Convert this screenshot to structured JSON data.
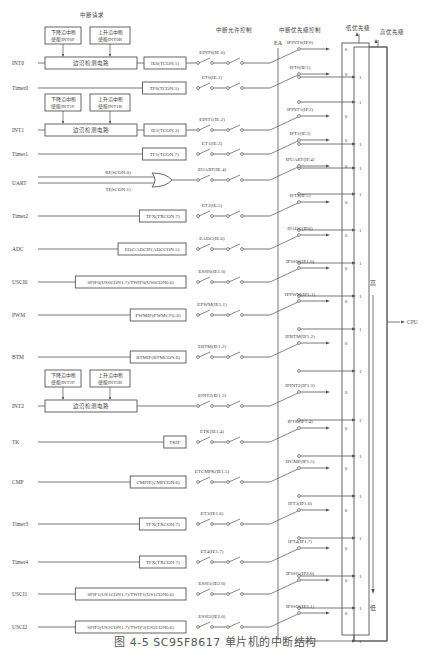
{
  "headers": {
    "interrupt_request": "中断请求",
    "enable_control": "中断允许控制",
    "priority_control": "中断优先级控制",
    "ea": "EA",
    "low_priority": "低优先级",
    "high_priority": "高优先级",
    "high_label": "高",
    "low_label": "低",
    "cpu": "CPU",
    "bit0": "0",
    "bit1": "1"
  },
  "edge_boxes": {
    "int0": {
      "falling": [
        "下降沿中断",
        "使能INT0F"
      ],
      "rising": [
        "上升沿中断",
        "使能INT0R"
      ],
      "detector": "边沿检测电路"
    },
    "int1": {
      "falling": [
        "下降沿中断",
        "使能INT1F"
      ],
      "rising": [
        "上升沿中断",
        "使能INT1R"
      ],
      "detector": "边沿检测电路"
    },
    "int2": {
      "falling": [
        "下降沿中断",
        "使能INT2F"
      ],
      "rising": [
        "上升沿中断",
        "使能INT2R"
      ],
      "detector": "边沿检测电路"
    }
  },
  "uart_inputs": {
    "ri": "RI(SCON.0)",
    "ti": "TI(SCON.1)"
  },
  "sources": [
    {
      "name": "INT0",
      "flag": "IE0(TCON.1)",
      "enable": "EINT0(IE.0)",
      "priority": "IPINT0(IP.0)",
      "type": "edge",
      "edge": "int0"
    },
    {
      "name": "Timer0",
      "flag": "TF0(TCON.5)",
      "enable": "ET0(IE.1)",
      "priority": "IPT0(IP.1)"
    },
    {
      "name": "INT1",
      "flag": "IE1(TCON.3)",
      "enable": "EINT1(IE.2)",
      "priority": "IPINT1(IP.2)",
      "type": "edge",
      "edge": "int1"
    },
    {
      "name": "Timer1",
      "flag": "TF1(TCON.7)",
      "enable": "ET1(IE.3)",
      "priority": "IPT1(IP.3)"
    },
    {
      "name": "UART",
      "flag": "",
      "enable": "EUART(IE.4)",
      "priority": "IPUART(IP.4)",
      "type": "or"
    },
    {
      "name": "Timer2",
      "flag": "TFX(TXCON.7)",
      "enable": "ET2(IE.5)",
      "priority": "IPT2(IP.5)"
    },
    {
      "name": "ADC",
      "flag": "EOC/ADCIF(ADCCON.5)",
      "enable": "EADC(IE.6)",
      "priority": "IPADC(IP.6)"
    },
    {
      "name": "USCI0",
      "flag": "SPIF0(US0CON1.7)/TWIF0(US0CON0.6)",
      "enable": "ESSI0(IE1.0)",
      "priority": "IPSSI0(IP1.0)"
    },
    {
      "name": "PWM",
      "flag": "PWMIF(PWMCFG.6)",
      "enable": "EPWM(IE1.1)",
      "priority": "IPPWM(IP1.1)"
    },
    {
      "name": "BTM",
      "flag": "BTMIF(BTMCON.6)",
      "enable": "EBTM(IE1.2)",
      "priority": "IPBTM(IP1.2)"
    },
    {
      "name": "INT2",
      "flag": "",
      "enable": "EINT2(IE1.3)",
      "priority": "IPINT2(IP1.3)",
      "type": "edge",
      "edge": "int2"
    },
    {
      "name": "TK",
      "flag": "TKIF",
      "enable": "ETK(IE1.4)",
      "priority": "IPTK(IP1.4)"
    },
    {
      "name": "CMP",
      "flag": "CMPIF(CMPCON.6)",
      "enable": "ETCMPK(IE1.5)",
      "priority": "IPCMP(IP1.5)"
    },
    {
      "name": "Timer3",
      "flag": "TFX(TXCON.7)",
      "enable": "ET3(IE1.6)",
      "priority": "IPT3(IP1.6)"
    },
    {
      "name": "Timer4",
      "flag": "TFX(TXCON.7)",
      "enable": "ET4(IE1.7)",
      "priority": "IPT4(IP1.7)"
    },
    {
      "name": "USCI1",
      "flag": "SPIF1(US1CON1.7)/TWIF1(US1CON0.6)",
      "enable": "ESSI1(IE2.0)",
      "priority": "IPSSI1(IP2.0)"
    },
    {
      "name": "USCI2",
      "flag": "SPIF2(US2CON1.7)/TWIF2(US2CON0.6)",
      "enable": "ESSI2(IE2.0)",
      "priority": "IPSSI2(IP2.1)"
    }
  ],
  "caption": "图 4-5  SC95F8617 单片机的中断结构"
}
